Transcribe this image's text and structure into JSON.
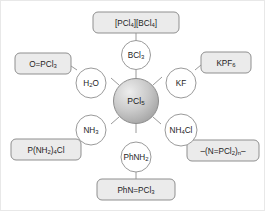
{
  "diagram": {
    "center": {
      "label": "PCl5",
      "formula_main": "PCl",
      "formula_sub": "5",
      "fill_light": "#e9e9e9",
      "fill_dark": "#a8a8a8"
    },
    "colors": {
      "box_fill": "#ebebeb",
      "box_stroke": "#8f8f8f",
      "circle_fill": "#ffffff",
      "circle_stroke": "#9a9a9a",
      "connector": "#9a9a9a",
      "text": "#1d1d1d",
      "frame": "#e8e8e8"
    },
    "branches": [
      {
        "id": "bcl3",
        "reagent": {
          "label": "BCl3",
          "parts": [
            {
              "t": "BCl",
              "sub": false
            },
            {
              "t": "3",
              "sub": true
            }
          ]
        },
        "product": {
          "label": "[PCl4][BCl4]",
          "parts": [
            {
              "t": "[PCl",
              "sub": false
            },
            {
              "t": "4",
              "sub": true
            },
            {
              "t": "][BCl",
              "sub": false
            },
            {
              "t": "4",
              "sub": true
            },
            {
              "t": "]",
              "sub": false
            }
          ]
        }
      },
      {
        "id": "h2o",
        "reagent": {
          "label": "H2O",
          "parts": [
            {
              "t": "H",
              "sub": false
            },
            {
              "t": "2",
              "sub": true
            },
            {
              "t": "O",
              "sub": false
            }
          ]
        },
        "product": {
          "label": "O=PCl3",
          "parts": [
            {
              "t": "O=PCl",
              "sub": false
            },
            {
              "t": "3",
              "sub": true
            }
          ]
        }
      },
      {
        "id": "kf",
        "reagent": {
          "label": "KF",
          "parts": [
            {
              "t": "KF",
              "sub": false
            }
          ]
        },
        "product": {
          "label": "KPF6",
          "parts": [
            {
              "t": "KPF",
              "sub": false
            },
            {
              "t": "6",
              "sub": true
            }
          ]
        }
      },
      {
        "id": "nh3",
        "reagent": {
          "label": "NH3",
          "parts": [
            {
              "t": "NH",
              "sub": false
            },
            {
              "t": "3",
              "sub": true
            }
          ]
        },
        "product": {
          "label": "P(NH2)4Cl",
          "parts": [
            {
              "t": "P(NH",
              "sub": false
            },
            {
              "t": "2",
              "sub": true
            },
            {
              "t": ")",
              "sub": false
            },
            {
              "t": "4",
              "sub": true
            },
            {
              "t": "Cl",
              "sub": false
            }
          ]
        }
      },
      {
        "id": "nh4cl",
        "reagent": {
          "label": "NH4Cl",
          "parts": [
            {
              "t": "NH",
              "sub": false
            },
            {
              "t": "4",
              "sub": true
            },
            {
              "t": "Cl",
              "sub": false
            }
          ]
        },
        "product": {
          "label": "-(N=PCl2)n-",
          "parts": [
            {
              "t": "–(N=PCl",
              "sub": false
            },
            {
              "t": "2",
              "sub": true
            },
            {
              "t": ")",
              "sub": false
            },
            {
              "t": "n",
              "sub": true
            },
            {
              "t": "–",
              "sub": false
            }
          ]
        }
      },
      {
        "id": "phnh2",
        "reagent": {
          "label": "PhNH2",
          "parts": [
            {
              "t": "PhNH",
              "sub": false
            },
            {
              "t": "2",
              "sub": true
            }
          ]
        },
        "product": {
          "label": "PhN=PCl3",
          "parts": [
            {
              "t": "PhN=PCl",
              "sub": false
            },
            {
              "t": "3",
              "sub": true
            }
          ]
        }
      }
    ]
  }
}
